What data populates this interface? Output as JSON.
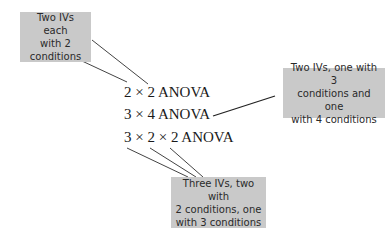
{
  "diagram": {
    "designs": [
      {
        "label": "2 × 2 ANOVA"
      },
      {
        "label": "3 × 4 ANOVA"
      },
      {
        "label": "3 × 2 × 2 ANOVA"
      }
    ],
    "callouts": [
      {
        "lines": [
          "Two IVs each",
          "with 2",
          "conditions"
        ],
        "points_to": "2 × 2 ANOVA"
      },
      {
        "lines": [
          "Two IVs, one with 3",
          "conditions and one",
          "with 4 conditions"
        ],
        "points_to": "3 × 4 ANOVA"
      },
      {
        "lines": [
          "Three IVs, two with",
          "2 conditions, one",
          "with 3 conditions"
        ],
        "points_to": "3 × 2 × 2 ANOVA"
      }
    ],
    "colors": {
      "callout_bg": "#c9c9c9",
      "leader_line": "#333333"
    }
  }
}
